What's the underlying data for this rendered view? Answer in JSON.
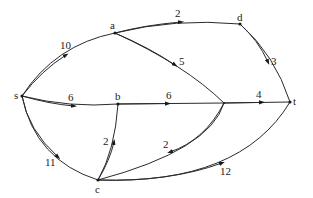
{
  "diagram": {
    "type": "directed weighted graph",
    "nodes": [
      {
        "id": "s",
        "label": "s"
      },
      {
        "id": "a",
        "label": "a"
      },
      {
        "id": "b",
        "label": "b"
      },
      {
        "id": "c",
        "label": "c"
      },
      {
        "id": "d",
        "label": "d"
      },
      {
        "id": "t",
        "label": "t"
      },
      {
        "id": "x",
        "label": ""
      }
    ],
    "edges": [
      {
        "from": "s",
        "to": "a",
        "weight": "10"
      },
      {
        "from": "a",
        "to": "d",
        "weight": "2"
      },
      {
        "from": "d",
        "to": "t",
        "weight": "3"
      },
      {
        "from": "a",
        "to": "x",
        "weight": "5"
      },
      {
        "from": "s",
        "to": "b",
        "weight": "6"
      },
      {
        "from": "b",
        "to": "x",
        "weight": "6"
      },
      {
        "from": "x",
        "to": "t",
        "weight": "4"
      },
      {
        "from": "s",
        "to": "c",
        "weight": "11"
      },
      {
        "from": "c",
        "to": "b",
        "weight": "2"
      },
      {
        "from": "x",
        "to": "c",
        "weight": "2"
      },
      {
        "from": "c",
        "to": "t",
        "weight": "12"
      }
    ]
  }
}
